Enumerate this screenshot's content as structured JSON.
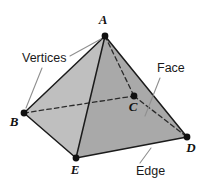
{
  "figure": {
    "shape": "square-pyramid",
    "colors": {
      "background": "#ffffff",
      "face_left": "#bdbdbd",
      "face_front": "#a8a8a8",
      "face_right": "#9f9f9f",
      "edge_solid": "#1c1c1c",
      "edge_hidden": "#2a2a2a",
      "vertex_dot": "#111111",
      "leader_line": "#8d8d8d",
      "label_text": "#1a1a1a"
    },
    "vertices": [
      {
        "id": "A",
        "label": "A",
        "x": 105,
        "y": 36,
        "label_x": 103,
        "label_y": 24,
        "hidden": false
      },
      {
        "id": "B",
        "label": "B",
        "x": 24,
        "y": 113,
        "label_x": 14,
        "label_y": 126,
        "hidden": false
      },
      {
        "id": "C",
        "label": "C",
        "x": 134,
        "y": 96,
        "label_x": 131,
        "label_y": 111,
        "hidden": true
      },
      {
        "id": "D",
        "label": "D",
        "x": 187,
        "y": 137,
        "label_x": 189,
        "label_y": 152,
        "hidden": false
      },
      {
        "id": "E",
        "label": "E",
        "x": 76,
        "y": 158,
        "label_x": 72,
        "label_y": 173,
        "hidden": false
      }
    ],
    "edges": [
      {
        "from": "A",
        "to": "B",
        "style": "solid"
      },
      {
        "from": "A",
        "to": "E",
        "style": "solid"
      },
      {
        "from": "A",
        "to": "D",
        "style": "solid"
      },
      {
        "from": "B",
        "to": "E",
        "style": "solid"
      },
      {
        "from": "E",
        "to": "D",
        "style": "solid"
      },
      {
        "from": "A",
        "to": "C",
        "style": "dashed"
      },
      {
        "from": "B",
        "to": "C",
        "style": "dashed"
      },
      {
        "from": "C",
        "to": "D",
        "style": "dashed"
      }
    ],
    "faces": [
      {
        "id": "face-left",
        "vertices": "A,B,E",
        "fill": "#bdbdbd"
      },
      {
        "id": "face-front",
        "vertices": "A,E,D",
        "fill": "#a8a8a8"
      }
    ],
    "annotations": [
      {
        "id": "vertices",
        "label": "Vertices",
        "text_x": 22,
        "text_y": 62,
        "leaders": [
          {
            "x1": 70,
            "y1": 56,
            "x2": 101,
            "y2": 39
          },
          {
            "x1": 42,
            "y1": 68,
            "x2": 26,
            "y2": 108
          }
        ]
      },
      {
        "id": "face",
        "label": "Face",
        "text_x": 157,
        "text_y": 72,
        "leaders": [
          {
            "x1": 160,
            "y1": 78,
            "x2": 145,
            "y2": 116
          }
        ]
      },
      {
        "id": "edge",
        "label": "Edge",
        "text_x": 136,
        "text_y": 175,
        "leaders": [
          {
            "x1": 140,
            "y1": 163,
            "x2": 151,
            "y2": 148
          }
        ]
      }
    ]
  }
}
